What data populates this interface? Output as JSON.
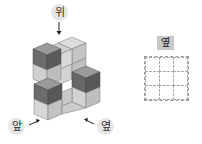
{
  "labels": {
    "top": "위",
    "front": "앞",
    "side": "옆"
  },
  "answer_grid": {
    "tag": "옆",
    "rows": 3,
    "cols": 3
  },
  "colors": {
    "dark_face": "#6f6f6f",
    "mid_face": "#a8a8a8",
    "light_face": "#d8d8d8",
    "label_bg": "#e6e6e6",
    "tag_bg": "#c8c8c8"
  }
}
